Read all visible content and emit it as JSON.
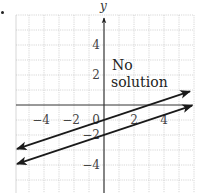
{
  "bullet": "•",
  "annotation": {
    "line1": "No",
    "line2": "solution"
  },
  "axes": {
    "ylabel": "y",
    "xlabel": "x"
  },
  "chart_data": {
    "type": "line",
    "title": "",
    "xlabel": "x",
    "ylabel": "y",
    "xlim": [
      -5.87,
      5.87
    ],
    "ylim": [
      -5.87,
      6
    ],
    "grid": true,
    "x_ticks": [
      {
        "value": -4,
        "label": "−4"
      },
      {
        "value": -2,
        "label": "−2"
      },
      {
        "value": 0,
        "label": "0"
      },
      {
        "value": 2,
        "label": "2"
      },
      {
        "value": 4,
        "label": "4"
      }
    ],
    "y_ticks": [
      {
        "value": 4,
        "label": "4"
      },
      {
        "value": 2,
        "label": "2"
      },
      {
        "value": -2,
        "label": "−2"
      },
      {
        "value": -4,
        "label": "−4"
      }
    ],
    "series": [
      {
        "name": "y = (1/3)x − 1",
        "slope": 0.3333,
        "intercept": -1,
        "x": [
          -5.8,
          5.73
        ],
        "y": [
          -2.93,
          0.91
        ],
        "arrows": "both"
      },
      {
        "name": "y = (1/3)x − 2",
        "slope": 0.3333,
        "intercept": -2,
        "x": [
          -5.8,
          5.87
        ],
        "y": [
          -3.93,
          -0.04
        ],
        "arrows": "both"
      }
    ],
    "annotations": [
      {
        "text": "No solution",
        "x": 0.5,
        "y": 2.5
      }
    ],
    "color": "#1a1a1a",
    "grid_color": "#bdbdbd"
  }
}
